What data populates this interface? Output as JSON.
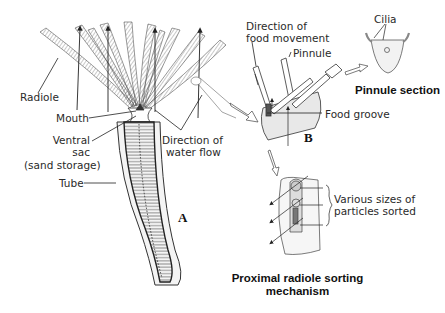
{
  "figure": {
    "panel_a": {
      "letter": "A",
      "labels": {
        "radiole": "Radiole",
        "mouth": "Mouth",
        "ventral_sac_1": "Ventral",
        "ventral_sac_2": "sac",
        "ventral_sac_3": "(sand storage)",
        "tube": "Tube",
        "water_flow_1": "Direction of",
        "water_flow_2": "water flow"
      }
    },
    "panel_b": {
      "letter": "B",
      "labels": {
        "food_movement_1": "Direction of",
        "food_movement_2": "food movement",
        "pinnule": "Pinnule",
        "food_groove": "Food groove"
      }
    },
    "pinnule_section": {
      "labels": {
        "cilia": "Cilia",
        "title": "Pinnule section"
      }
    },
    "sorting": {
      "labels": {
        "particles_1": "Various sizes of",
        "particles_2": "particles sorted",
        "title_1": "Proximal radiole sorting",
        "title_2": "mechanism"
      }
    }
  }
}
